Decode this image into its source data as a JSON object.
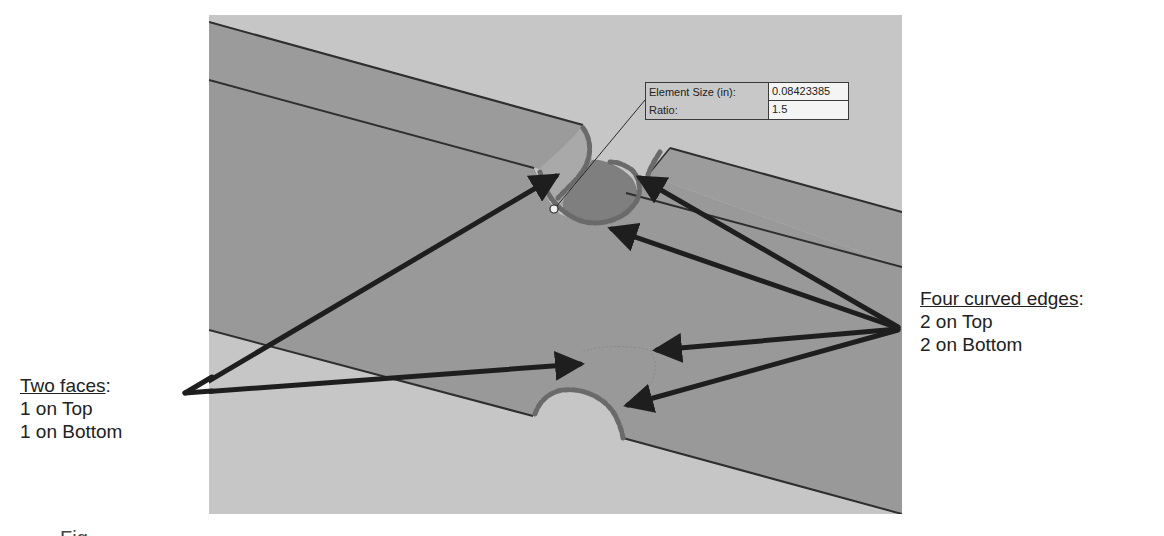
{
  "figure": {
    "title_fragment": "",
    "caption_fragment": "Fig"
  },
  "viewport": {
    "colors": {
      "background": "#c6c6c6",
      "beam_face": "#9b9b9b",
      "beam_face_lower": "#999999",
      "cylinder_face_light": "#a8a8a8",
      "notch_face_dark": "#7e7e7e",
      "edge_line": "#2e2e2e",
      "selected_edge": "#6a6a6a",
      "arrow": "#1e1e1e"
    }
  },
  "mesh_dialog": {
    "rows": [
      {
        "label": "Element Size (in):",
        "value": "0.08423385"
      },
      {
        "label": "Ratio:",
        "value": "1.5"
      }
    ]
  },
  "annotations": {
    "left": {
      "heading": "Two faces",
      "heading_suffix": ":",
      "lines": [
        "1 on Top",
        "1 on Bottom"
      ]
    },
    "right": {
      "heading": "Four curved edges",
      "heading_suffix": ":",
      "lines": [
        "2 on Top",
        "2 on Bottom"
      ]
    }
  }
}
